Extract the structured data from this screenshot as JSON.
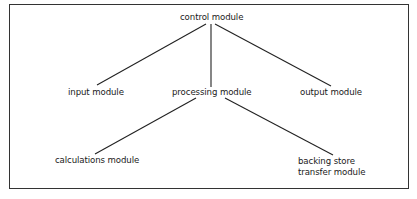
{
  "diagram": {
    "type": "hierarchy-tree",
    "nodes": {
      "root": "control module",
      "input": "input module",
      "processing": "processing module",
      "output": "output module",
      "calculations": "calculations module",
      "backing_line1": "backing store",
      "backing_line2": "transfer module"
    },
    "edges": [
      [
        "control module",
        "input module"
      ],
      [
        "control module",
        "processing module"
      ],
      [
        "control module",
        "output module"
      ],
      [
        "processing module",
        "calculations module"
      ],
      [
        "processing module",
        "backing store transfer module"
      ]
    ]
  }
}
